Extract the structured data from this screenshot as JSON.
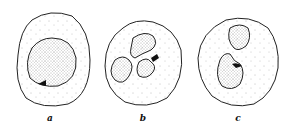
{
  "figure": {
    "panels": [
      {
        "label": "a",
        "description": "cell with round nucleus"
      },
      {
        "label": "b",
        "description": "cell with multilobed nucleus"
      },
      {
        "label": "c",
        "description": "cell with bilobed kidney-shaped nucleus"
      }
    ],
    "colors": {
      "stroke": "#222222",
      "background": "#ffffff",
      "stipple": "#555555"
    }
  }
}
